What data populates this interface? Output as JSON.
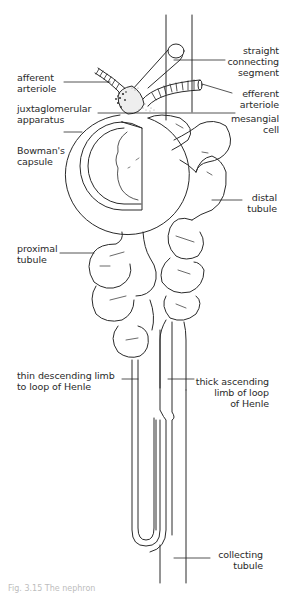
{
  "figure": {
    "caption": "Fig. 3.15 The nephron",
    "labels": {
      "straight_connecting_segment": "straight\nconnecting\nsegment",
      "afferent_arteriole": "afferent\narteriole",
      "efferent_arteriole": "efferent\narteriole",
      "juxtaglomerular_apparatus": "juxtaglomerular\napparatus",
      "mesangial_cell": "mesangial\ncell",
      "bowmans_capsule": "Bowman's\ncapsule",
      "distal_tubule": "distal\ntubule",
      "proximal_tubule": "proximal\ntubule",
      "thin_descending_limb": "thin descending limb\nto loop of Henle",
      "thick_ascending_limb": "thick ascending\nlimb of loop\nof Henle",
      "collecting_tubule": "collecting\ntubule"
    },
    "colors": {
      "line": "#2a2a2a",
      "background": "#ffffff",
      "stipple": "#555555"
    }
  }
}
